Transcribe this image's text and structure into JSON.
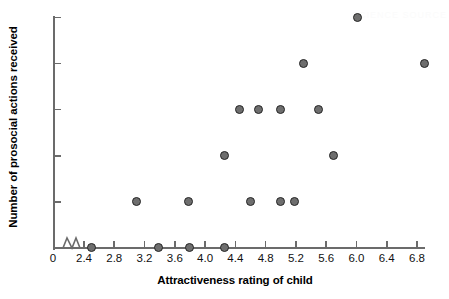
{
  "chart_data": {
    "type": "scatter",
    "title": "",
    "xlabel": "Attractiveness rating of child",
    "ylabel": "Number of prosocial actions received",
    "xlim": [
      2.25,
      7.0
    ],
    "ylim": [
      0,
      5
    ],
    "x_axis_break": true,
    "x_origin_label": "0",
    "xticks": [
      2.4,
      2.8,
      3.2,
      3.6,
      4.0,
      4.4,
      4.8,
      5.2,
      5.6,
      6.0,
      6.4,
      6.8
    ],
    "xticklabels": [
      "2.4",
      "2.8",
      "3.2",
      "3.6",
      "4.0",
      "4.4",
      "4.8",
      "5.2",
      "5.6",
      "6.0",
      "6.4",
      "6.8"
    ],
    "yticks": [
      0,
      1,
      2,
      3,
      4,
      5
    ],
    "yticklabels": [
      "0",
      "1",
      "2",
      "3",
      "4",
      "5"
    ],
    "grid": false,
    "legend": false,
    "marker": {
      "shape": "circle",
      "fill_color": "#6e6e6e",
      "edge_color": "#262626",
      "size_px": 9
    },
    "points": [
      {
        "x": 2.5,
        "y": 0
      },
      {
        "x": 3.38,
        "y": 0
      },
      {
        "x": 3.8,
        "y": 0
      },
      {
        "x": 4.25,
        "y": 0
      },
      {
        "x": 3.1,
        "y": 1
      },
      {
        "x": 3.78,
        "y": 1
      },
      {
        "x": 4.6,
        "y": 1
      },
      {
        "x": 5.0,
        "y": 1
      },
      {
        "x": 5.18,
        "y": 1
      },
      {
        "x": 4.25,
        "y": 2
      },
      {
        "x": 5.7,
        "y": 2
      },
      {
        "x": 4.45,
        "y": 3
      },
      {
        "x": 4.7,
        "y": 3
      },
      {
        "x": 5.0,
        "y": 3
      },
      {
        "x": 5.5,
        "y": 3
      },
      {
        "x": 5.3,
        "y": 4
      },
      {
        "x": 6.9,
        "y": 4
      },
      {
        "x": 6.02,
        "y": 5
      }
    ]
  },
  "figure": {
    "background_color": "#ffffff",
    "axis_color": "#6b6b6b",
    "text_color": "#111111",
    "watermark_text": "SCIENCE SOURCE"
  }
}
